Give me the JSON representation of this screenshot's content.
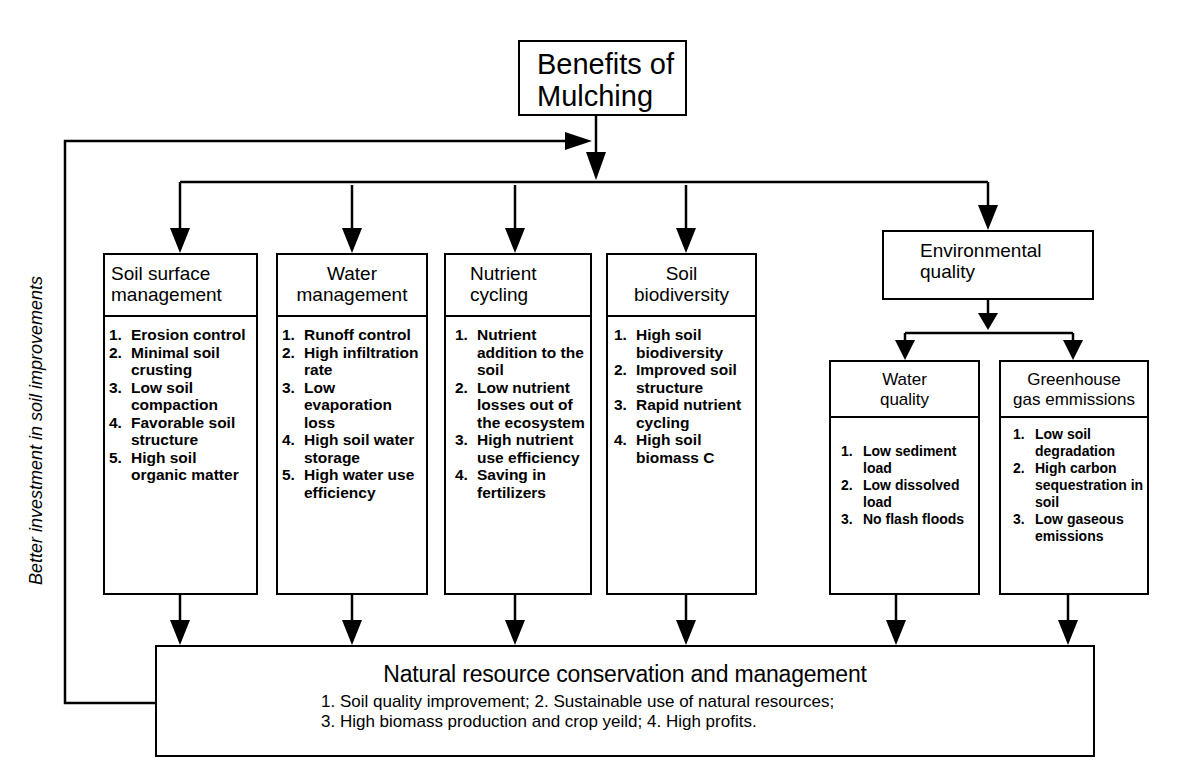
{
  "diagram": {
    "root": {
      "title_line1": "Benefits of",
      "title_line2": "Mulching"
    },
    "feedback_label": "Better investment in soil improvements",
    "categories": [
      {
        "title_line1": "Soil surface",
        "title_line2": "management",
        "items": [
          {
            "num": "1.",
            "text": "Erosion control"
          },
          {
            "num": "2.",
            "text": "Minimal soil crusting"
          },
          {
            "num": "3.",
            "text": "Low soil compaction"
          },
          {
            "num": "4.",
            "text": "Favorable soil structure"
          },
          {
            "num": "5.",
            "text": "High soil organic matter"
          }
        ]
      },
      {
        "title_line1": "Water",
        "title_line2": "management",
        "items": [
          {
            "num": "1.",
            "text": "Runoff control"
          },
          {
            "num": "2.",
            "text": "High infiltration rate"
          },
          {
            "num": "3.",
            "text": "Low evaporation loss"
          },
          {
            "num": "4.",
            "text": "High soil water storage"
          },
          {
            "num": "5.",
            "text": "High water use efficiency"
          }
        ]
      },
      {
        "title_line1": "Nutrient",
        "title_line2": "cycling",
        "items": [
          {
            "num": "1.",
            "text": "Nutrient addition to the soil"
          },
          {
            "num": "2.",
            "text": "Low nutrient losses out of the ecosystem"
          },
          {
            "num": "3.",
            "text": "High nutrient use efficiency"
          },
          {
            "num": "4.",
            "text": "Saving in fertilizers"
          }
        ]
      },
      {
        "title_line1": "Soil",
        "title_line2": "biodiversity",
        "items": [
          {
            "num": "1.",
            "text": "High soil biodiversity"
          },
          {
            "num": "2.",
            "text": "Improved soil structure"
          },
          {
            "num": "3.",
            "text": "Rapid nutrient cycling"
          },
          {
            "num": "4.",
            "text": "High soil biomass C"
          }
        ]
      }
    ],
    "environmental": {
      "title_line1": "Environmental",
      "title_line2": "quality",
      "children": [
        {
          "title_line1": "Water",
          "title_line2": "quality",
          "items": [
            {
              "num": "1.",
              "text": "Low sediment load"
            },
            {
              "num": "2.",
              "text": "Low dissolved load"
            },
            {
              "num": "3.",
              "text": "No flash floods"
            }
          ]
        },
        {
          "title_line1": "Greenhouse",
          "title_line2": "gas emmissions",
          "items": [
            {
              "num": "1.",
              "text": "Low soil degradation"
            },
            {
              "num": "2.",
              "text": "High carbon sequestration in soil"
            },
            {
              "num": "3.",
              "text": "Low gaseous emissions"
            }
          ]
        }
      ]
    },
    "outcome": {
      "title": "Natural resource conservation and management",
      "line1": "1. Soil quality improvement;  2. Sustainable use of natural resources;",
      "line2": "3. High biomass production and crop yeild;  4. High profits."
    },
    "colors": {
      "line": "#000000",
      "background": "#ffffff"
    }
  }
}
